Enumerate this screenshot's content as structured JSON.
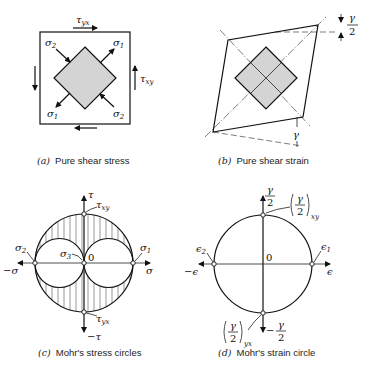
{
  "panels": {
    "a": {
      "caption_letter": "(a)",
      "caption_text": "Pure shear stress",
      "labels": {
        "tau_yx": "τ",
        "tau_yx_sub": "yx",
        "tau_xy": "τ",
        "tau_xy_sub": "xy",
        "sigma1_tr": "σ",
        "sigma1_tr_sub": "1",
        "sigma2_tl": "σ",
        "sigma2_tl_sub": "2",
        "sigma1_bl": "σ",
        "sigma1_bl_sub": "1",
        "sigma2_br": "σ",
        "sigma2_br_sub": "2"
      }
    },
    "b": {
      "caption_letter": "(b)",
      "caption_text": "Pure shear strain",
      "labels": {
        "gamma_half_num": "γ",
        "gamma_half_den": "2",
        "gamma": "γ"
      }
    },
    "c": {
      "caption_letter": "(c)",
      "caption_text": "Mohr's stress circles",
      "labels": {
        "tau_axis": "τ",
        "neg_tau_axis": "−τ",
        "sigma_axis": "σ",
        "neg_sigma_axis": "−σ",
        "origin": "0",
        "sigma1": "σ",
        "sigma1_sub": "1",
        "sigma2": "σ",
        "sigma2_sub": "2",
        "sigma3": "σ",
        "sigma3_sub": "3",
        "tau_xy": "τ",
        "tau_xy_sub": "xy",
        "tau_yx": "τ",
        "tau_yx_sub": "yx"
      }
    },
    "d": {
      "caption_letter": "(d)",
      "caption_text": "Mohr's strain circle",
      "labels": {
        "gamma_axis_num": "γ",
        "gamma_axis_den": "2",
        "neg_gamma_axis_minus": "−",
        "neg_gamma_axis_num": "γ",
        "neg_gamma_axis_den": "2",
        "eps_axis": "ϵ",
        "neg_eps_axis": "−ϵ",
        "origin": "0",
        "eps1": "ϵ",
        "eps1_sub": "1",
        "eps2": "ϵ",
        "eps2_sub": "2",
        "gxy_num": "γ",
        "gxy_den": "2",
        "gxy_sub": "xy",
        "gyx_num": "γ",
        "gyx_den": "2",
        "gyx_sub": "yx"
      }
    }
  }
}
